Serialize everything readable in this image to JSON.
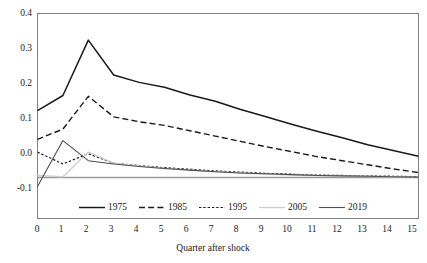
{
  "chart_data": {
    "type": "line",
    "title": "",
    "xlabel": "Quarter after shock",
    "ylabel": "",
    "x": [
      0,
      1,
      2,
      3,
      4,
      5,
      6,
      7,
      8,
      9,
      10,
      11,
      12,
      13,
      14,
      15
    ],
    "xlim": [
      0,
      15
    ],
    "ylim": [
      -0.1,
      0.4
    ],
    "xticks": [
      "0",
      "1",
      "2",
      "3",
      "4",
      "5",
      "6",
      "7",
      "8",
      "9",
      "10",
      "11",
      "12",
      "13",
      "14",
      "15"
    ],
    "yticks": [
      "-0.1",
      "0.0",
      "0.1",
      "0.2",
      "0.3",
      "0.4"
    ],
    "ytick_values": [
      -0.1,
      0.0,
      0.1,
      0.2,
      0.3,
      0.4
    ],
    "grid": false,
    "legend_position": "bottom-inside",
    "zero_line": 0.0,
    "series": [
      {
        "name": "1975",
        "style": "solid",
        "color": "#1a1a1a",
        "width": 1.5,
        "values": [
          0.163,
          0.2,
          0.335,
          0.25,
          0.232,
          0.22,
          0.201,
          0.186,
          0.166,
          0.148,
          0.13,
          0.113,
          0.097,
          0.08,
          0.066,
          0.052
        ]
      },
      {
        "name": "1985",
        "style": "dashed",
        "color": "#1a1a1a",
        "width": 1.4,
        "values": [
          0.093,
          0.118,
          0.198,
          0.148,
          0.136,
          0.127,
          0.114,
          0.101,
          0.088,
          0.075,
          0.063,
          0.051,
          0.041,
          0.031,
          0.021,
          0.012
        ]
      },
      {
        "name": "1995",
        "style": "dotted",
        "color": "#1a1a1a",
        "width": 1.2,
        "values": [
          0.062,
          0.033,
          0.058,
          0.035,
          0.029,
          0.024,
          0.02,
          0.016,
          0.013,
          0.01,
          0.008,
          0.006,
          0.005,
          0.004,
          0.003,
          0.002
        ]
      },
      {
        "name": "2005",
        "style": "solid",
        "color": "#cfcfcf",
        "width": 1.4,
        "values": [
          0.005,
          0.002,
          0.062,
          0.035,
          0.028,
          0.022,
          0.018,
          0.014,
          0.011,
          0.008,
          0.006,
          0.005,
          0.004,
          0.003,
          0.002,
          0.001
        ]
      },
      {
        "name": "2019",
        "style": "solid",
        "color": "#4d4d4d",
        "width": 1.1,
        "values": [
          -0.022,
          0.09,
          0.041,
          0.033,
          0.027,
          0.022,
          0.018,
          0.014,
          0.011,
          0.009,
          0.007,
          0.005,
          0.004,
          0.003,
          0.002,
          0.001
        ]
      }
    ]
  },
  "axes": {
    "x_title": "Quarter after shock"
  },
  "legend": {
    "entries": [
      {
        "label": "1975"
      },
      {
        "label": "1985"
      },
      {
        "label": "1995"
      },
      {
        "label": "2005"
      },
      {
        "label": "2019"
      }
    ]
  },
  "colors": {
    "axis": "#808080",
    "zero_line": "#999999",
    "text": "#1a1a1a",
    "background": "#ffffff"
  }
}
